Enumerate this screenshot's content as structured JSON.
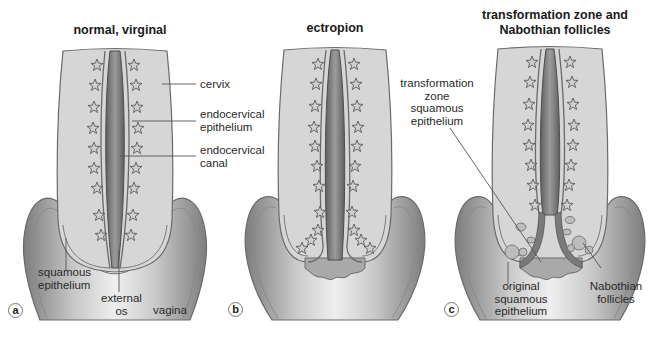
{
  "figure": {
    "panels": [
      {
        "id": "a",
        "title": "normal, virginal",
        "letter": "a",
        "labels": {
          "cervix": "cervix",
          "endocervical_epithelium": "endocervical\nepithelium",
          "endocervical_canal": "endocervical\ncanal",
          "squamous_epithelium": "squamous\nepithelium",
          "external_os": "external\nos",
          "vagina": "vagina"
        }
      },
      {
        "id": "b",
        "title": "ectropion",
        "letter": "b",
        "labels": {
          "transformation_zone": "transformation\nzone\nsquamous\nepithelium"
        }
      },
      {
        "id": "c",
        "title": "transformation zone and\nNabothian follicles",
        "letter": "c",
        "labels": {
          "original_squamous": "original\nsquamous\nepithelium",
          "nabothian": "Nabothian\nfollicles"
        }
      }
    ],
    "colors": {
      "cervix_fill": "#d6d6d6",
      "cervix_stroke": "#6a6a6a",
      "canal_dark": "#6e6e6e",
      "canal_mid": "#9a9a9a",
      "gland_stroke": "#5a5a5a",
      "vagina_dark": "#8a8a8a",
      "vagina_light": "#f0f0f0",
      "ectropion_fill": "#a9a9a9",
      "follicle_fill": "#bdbdbd"
    }
  }
}
